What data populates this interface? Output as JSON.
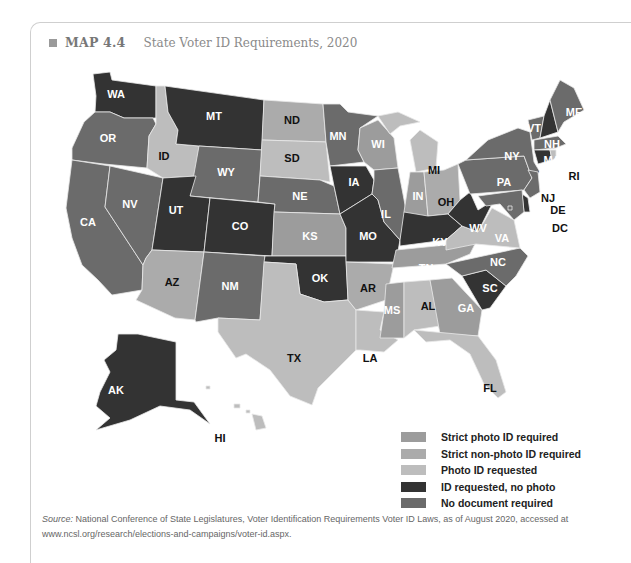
{
  "header": {
    "map_number": "MAP 4.4",
    "title": "State Voter ID Requirements, 2020"
  },
  "colors": {
    "strict_photo": "#9c9c9c",
    "strict_nonphoto": "#ababab",
    "photo_requested": "#bdbdbd",
    "id_no_photo": "#333333",
    "no_document": "#6b6b6b"
  },
  "legend": [
    {
      "key": "strict_photo",
      "label": "Strict photo ID required",
      "color": "#9c9c9c"
    },
    {
      "key": "strict_nonphoto",
      "label": "Strict non-photo ID required",
      "color": "#ababab"
    },
    {
      "key": "photo_requested",
      "label": "Photo ID requested",
      "color": "#bdbdbd"
    },
    {
      "key": "id_no_photo",
      "label": "ID requested, no photo",
      "color": "#333333"
    },
    {
      "key": "no_document",
      "label": "No document required",
      "color": "#6b6b6b"
    }
  ],
  "states": {
    "WA": "id_no_photo",
    "OR": "no_document",
    "CA": "no_document",
    "NV": "no_document",
    "ID": "photo_requested",
    "MT": "id_no_photo",
    "WY": "no_document",
    "UT": "id_no_photo",
    "CO": "id_no_photo",
    "AZ": "strict_nonphoto",
    "NM": "no_document",
    "ND": "strict_nonphoto",
    "SD": "photo_requested",
    "NE": "no_document",
    "KS": "strict_photo",
    "OK": "id_no_photo",
    "TX": "photo_requested",
    "MN": "no_document",
    "IA": "id_no_photo",
    "MO": "id_no_photo",
    "AR": "strict_nonphoto",
    "LA": "photo_requested",
    "WI": "strict_photo",
    "IL": "no_document",
    "MI": "photo_requested",
    "IN": "strict_photo",
    "OH": "strict_nonphoto",
    "KY": "id_no_photo",
    "TN": "strict_photo",
    "MS": "strict_photo",
    "AL": "photo_requested",
    "GA": "strict_photo",
    "FL": "photo_requested",
    "SC": "id_no_photo",
    "NC": "no_document",
    "VA": "photo_requested",
    "WV": "id_no_photo",
    "PA": "no_document",
    "NY": "no_document",
    "VT": "no_document",
    "NH": "id_no_photo",
    "ME": "no_document",
    "MA": "no_document",
    "RI": "photo_requested",
    "CT": "id_no_photo",
    "NJ": "no_document",
    "DE": "id_no_photo",
    "MD": "no_document",
    "DC": "no_document",
    "AK": "id_no_photo",
    "HI": "photo_requested"
  },
  "state_labels": {
    "WA": "WA",
    "OR": "OR",
    "CA": "CA",
    "NV": "NV",
    "ID": "ID",
    "MT": "MT",
    "WY": "WY",
    "UT": "UT",
    "CO": "CO",
    "AZ": "AZ",
    "NM": "NM",
    "ND": "ND",
    "SD": "SD",
    "NE": "NE",
    "KS": "KS",
    "OK": "OK",
    "TX": "TX",
    "MN": "MN",
    "IA": "IA",
    "MO": "MO",
    "AR": "AR",
    "LA": "LA",
    "WI": "WI",
    "IL": "IL",
    "MI": "MI",
    "IN": "IN",
    "OH": "OH",
    "KY": "KY",
    "TN": "TN",
    "MS": "MS",
    "AL": "AL",
    "GA": "GA",
    "FL": "FL",
    "SC": "SC",
    "NC": "NC",
    "VA": "VA",
    "WV": "WV",
    "PA": "PA",
    "NY": "NY",
    "VT": "VT",
    "NH": "NH",
    "ME": "ME",
    "MA": "MA",
    "RI": "RI",
    "CT": "CT",
    "NJ": "NJ",
    "DE": "DE",
    "MD": "MD",
    "DC": "DC",
    "AK": "AK",
    "HI": "HI"
  },
  "source": {
    "prefix": "Source:",
    "text": " National Conference of State Legislatures, Voter Identification Requirements Voter ID Laws, as of August 2020, accessed at www.ncsl.org/research/elections-and-campaigns/voter-id.aspx."
  }
}
